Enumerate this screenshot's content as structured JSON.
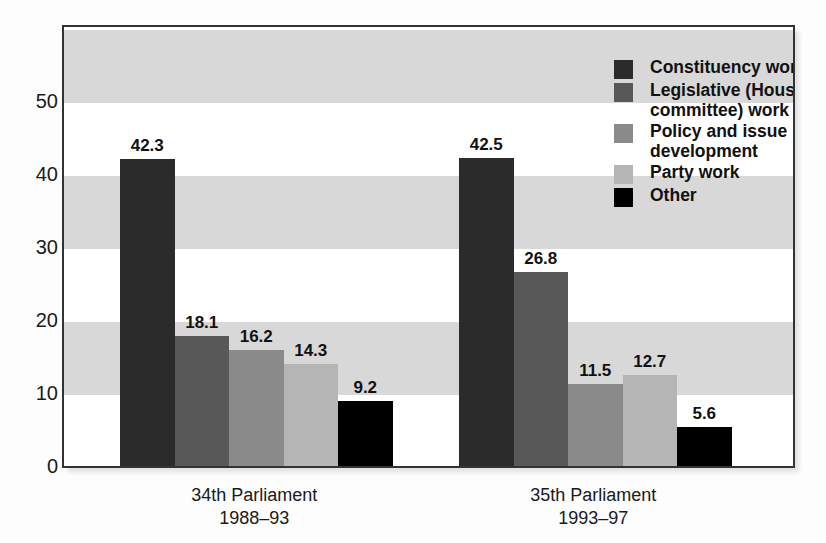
{
  "chart_data": {
    "type": "bar",
    "title": "",
    "subtitle": "",
    "xlabel": "",
    "ylabel": "",
    "ylim": [
      0,
      60.4
    ],
    "yticks": [
      0,
      10,
      20,
      30,
      40,
      50
    ],
    "grid": "horizontal alternating shaded bands every 10 units",
    "legend_position": "top-right inside plot area",
    "categories": [
      "34th Parliament\n1988–93",
      "35th Parliament\n1993–97"
    ],
    "category_lines": [
      {
        "name": "34th Parliament",
        "years": "1988–93"
      },
      {
        "name": "35th Parliament",
        "years": "1993–97"
      }
    ],
    "series": [
      {
        "name": "Constituency work",
        "color": "#2b2b2b",
        "values": [
          42.3,
          42.5
        ]
      },
      {
        "name": "Legislative (House/\ncommittee) work",
        "color": "#585858",
        "values": [
          18.1,
          26.8
        ]
      },
      {
        "name": "Policy and issue\ndevelopment",
        "color": "#8a8a8a",
        "values": [
          16.2,
          11.5
        ]
      },
      {
        "name": "Party work",
        "color": "#b5b5b5",
        "values": [
          14.3,
          12.7
        ]
      },
      {
        "name": "Other",
        "color": "#000000",
        "values": [
          9.2,
          5.6
        ]
      }
    ],
    "data_labels": [
      [
        "42.3",
        "18.1",
        "16.2",
        "14.3",
        "9.2"
      ],
      [
        "42.5",
        "26.8",
        "11.5",
        "12.7",
        "5.6"
      ]
    ],
    "ytick_labels": [
      "0",
      "10",
      "20",
      "30",
      "40",
      "50"
    ]
  },
  "legend": {
    "items": [
      {
        "label": "Constituency work",
        "color": "#2b2b2b"
      },
      {
        "label": "Legislative (House/\ncommittee) work",
        "color": "#585858"
      },
      {
        "label": "Policy and issue\ndevelopment",
        "color": "#8a8a8a"
      },
      {
        "label": "Party work",
        "color": "#b5b5b5"
      },
      {
        "label": "Other",
        "color": "#000000"
      }
    ]
  },
  "colors": {
    "band_shaded": "#d8d8d8",
    "band_plain": "#ffffff",
    "frame": "#333333",
    "page_background": "#fdfdfd",
    "text": "#111111"
  }
}
